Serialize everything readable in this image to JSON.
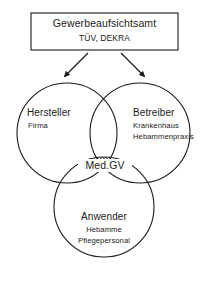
{
  "diagram": {
    "type": "venn-three-circle",
    "title_box": {
      "title": "Gewerbeaufsichtsamt",
      "subtitle": "TÜV, DEKRA",
      "border_color": "#1a1a1a"
    },
    "arrows": [
      {
        "name": "arrow-to-hersteller",
        "direction": "down-left"
      },
      {
        "name": "arrow-to-betreiber",
        "direction": "down-right"
      }
    ],
    "circles": [
      {
        "id": "hersteller",
        "label": "Hersteller",
        "items": [
          "Firma"
        ]
      },
      {
        "id": "betreiber",
        "label": "Betreiber",
        "items": [
          "Krankenhaus",
          "Hebammenpraxis"
        ]
      },
      {
        "id": "anwender",
        "label": "Anwender",
        "items": [
          "Hebamme",
          "Pflegepersonal"
        ]
      }
    ],
    "intersection": {
      "label": "Med.GV",
      "fill": "hatched",
      "stroke_color": "#1a1a1a"
    },
    "colors": {
      "stroke": "#1a1a1a",
      "background": "#ffffff",
      "text": "#1a1a1a"
    }
  }
}
